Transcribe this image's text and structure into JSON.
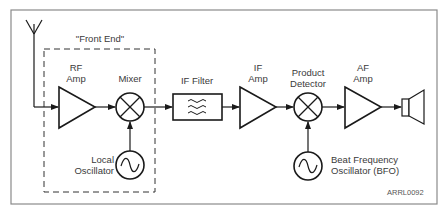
{
  "diagram": {
    "title_group": "\"Front End\"",
    "blocks": [
      {
        "id": "rf_amp",
        "type": "amplifier",
        "label_line1": "RF",
        "label_line2": "Amp"
      },
      {
        "id": "mixer",
        "type": "mixer",
        "label": "Mixer"
      },
      {
        "id": "local_osc",
        "type": "oscillator",
        "label_line1": "Local",
        "label_line2": "Oscillator"
      },
      {
        "id": "if_filter",
        "type": "filter",
        "label": "IF Filter"
      },
      {
        "id": "if_amp",
        "type": "amplifier",
        "label_line1": "IF",
        "label_line2": "Amp"
      },
      {
        "id": "product_detector",
        "type": "mixer",
        "label_line1": "Product",
        "label_line2": "Detector"
      },
      {
        "id": "bfo",
        "type": "oscillator",
        "label_line1": "Beat Frequency",
        "label_line2": "Oscillator (BFO)"
      },
      {
        "id": "af_amp",
        "type": "amplifier",
        "label_line1": "AF",
        "label_line2": "Amp"
      },
      {
        "id": "speaker",
        "type": "speaker"
      }
    ],
    "connections": [
      [
        "antenna",
        "rf_amp"
      ],
      [
        "rf_amp",
        "mixer"
      ],
      [
        "local_osc",
        "mixer"
      ],
      [
        "mixer",
        "if_filter"
      ],
      [
        "if_filter",
        "if_amp"
      ],
      [
        "if_amp",
        "product_detector"
      ],
      [
        "bfo",
        "product_detector"
      ],
      [
        "product_detector",
        "af_amp"
      ],
      [
        "af_amp",
        "speaker"
      ]
    ],
    "figure_code": "ARRL0092",
    "colors": {
      "stroke": "#1a1a1a",
      "frame": "#8a8a8a",
      "text": "#3a3a3a"
    }
  }
}
